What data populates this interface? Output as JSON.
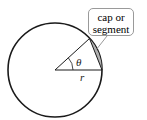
{
  "diagram": {
    "type": "circle-segment",
    "callout_label": "cap or segment",
    "callout_line1": "cap or",
    "callout_line2": "segment",
    "angle_label": "θ",
    "radius_label": "r",
    "colors": {
      "stroke": "#1a1a1a",
      "segment_fill": "#b0b0b0",
      "callout_border": "#9a9a9a"
    }
  }
}
